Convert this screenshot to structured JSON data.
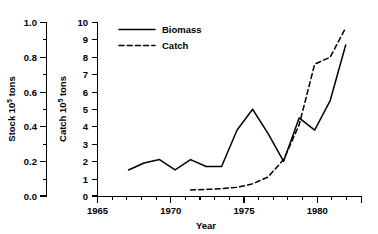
{
  "chart_data": {
    "type": "line",
    "title": "",
    "xlabel": "Year",
    "ylabel_left": "Stock 10⁵ tons",
    "ylabel_right": "Catch 10⁵ tons",
    "ylabel_left_base": "Stock 10",
    "ylabel_left_exp": "5",
    "ylabel_left_unit": " tons",
    "ylabel_right_base": "Catch 10",
    "ylabel_right_exp": "5",
    "ylabel_right_unit": " tons",
    "grid": false,
    "legend_position": "top-center",
    "xlim": [
      1965,
      1982
    ],
    "xticks": [
      1965,
      1970,
      1975,
      1980
    ],
    "xtick_labels": [
      "1965",
      "1970",
      "1975",
      "1980"
    ],
    "x_minor_step": 1,
    "ylim_left": [
      0.0,
      1.0
    ],
    "yticks_left": [
      0.0,
      0.2,
      0.4,
      0.6,
      0.8,
      1.0
    ],
    "ytick_labels_left": [
      "0.0",
      "0.2",
      "0.4",
      "0.6",
      "0.8",
      "1.0"
    ],
    "y_minor_step_left": 0.1,
    "ylim_right": [
      0,
      10
    ],
    "yticks_right": [
      0,
      1,
      2,
      3,
      4,
      5,
      6,
      7,
      8,
      9,
      10
    ],
    "ytick_labels_right": [
      "0",
      "1",
      "2",
      "3",
      "4",
      "5",
      "6",
      "7",
      "8",
      "9",
      "10"
    ],
    "series": [
      {
        "name": "Biomass",
        "style": "solid",
        "axis": "left",
        "color": "#000000",
        "x": [
          1967,
          1968,
          1969,
          1970,
          1971,
          1972,
          1973,
          1974,
          1975,
          1976,
          1977,
          1978,
          1979,
          1980,
          1981
        ],
        "values": [
          0.15,
          0.19,
          0.21,
          0.15,
          0.21,
          0.17,
          0.17,
          0.38,
          0.5,
          0.36,
          0.2,
          0.45,
          0.38,
          0.55,
          0.87
        ]
      },
      {
        "name": "Catch",
        "style": "dashed",
        "axis": "right",
        "color": "#000000",
        "x": [
          1971,
          1972,
          1973,
          1974,
          1975,
          1976,
          1977,
          1978,
          1979,
          1980,
          1981
        ],
        "values": [
          0.35,
          0.38,
          0.42,
          0.5,
          0.7,
          1.1,
          2.1,
          4.1,
          7.6,
          8.0,
          9.7
        ]
      }
    ],
    "legend": [
      {
        "label": "Biomass",
        "style": "solid"
      },
      {
        "label": "Catch",
        "style": "dashed"
      }
    ]
  }
}
